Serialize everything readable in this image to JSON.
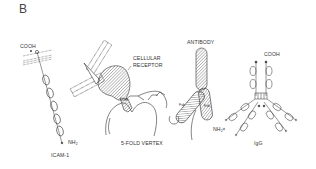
{
  "figure": {
    "panel_label": "B",
    "structures": [
      {
        "name": "ICAM-1",
        "label": "ICAM-1",
        "top_terminal": "COOH",
        "bottom_terminal": "NH",
        "bottom_terminal_sub": "2",
        "domains": 5
      },
      {
        "name": "Cellular receptor bound to 5-fold vertex",
        "receptor_label_line1": "CELLULAR",
        "receptor_label_line2": "RECEPTOR",
        "vertex_label": "5-FOLD VERTEX"
      },
      {
        "name": "Antibody",
        "label": "ANTIBODY",
        "fab_label": "Fab",
        "fab_label_2": "Fab",
        "terminal": "NH",
        "terminal_sub": "2"
      },
      {
        "name": "IgG",
        "label": "IgG",
        "top_terminal": "COOH"
      }
    ]
  }
}
